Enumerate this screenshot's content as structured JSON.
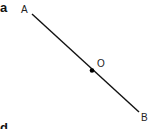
{
  "panels": [
    {
      "label": "a"
    },
    {
      "label": "d"
    }
  ],
  "points": [
    {
      "name": "A"
    },
    {
      "name": "O"
    },
    {
      "name": "B"
    }
  ],
  "colors": {
    "line": "#111111",
    "text": "#222222",
    "background": "#ffffff"
  }
}
